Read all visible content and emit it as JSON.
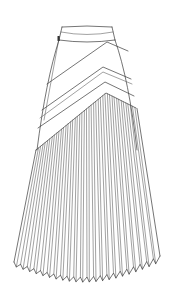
{
  "figure": {
    "colors": {
      "background": "#ffffff",
      "line": "#3a3a3a"
    },
    "parts": [
      {
        "name": "waistband"
      },
      {
        "name": "side-zipper"
      },
      {
        "name": "chevron-panel-upper"
      },
      {
        "name": "chevron-panel-middle"
      },
      {
        "name": "pleated-hem-section",
        "pleat_count": 22
      }
    ]
  }
}
